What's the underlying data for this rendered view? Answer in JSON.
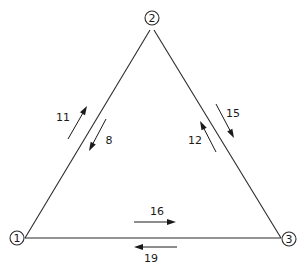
{
  "diagram": {
    "type": "directed-flow-graph",
    "title": "",
    "background_color": "#ffffff",
    "line_color": "#2b2b2b",
    "label_color": "#1a1a1a",
    "nodes": [
      {
        "id": "1",
        "label": "1",
        "x": 17,
        "y": 238,
        "radius": 7
      },
      {
        "id": "2",
        "label": "2",
        "x": 152,
        "y": 18,
        "radius": 7
      },
      {
        "id": "3",
        "label": "3",
        "x": 289,
        "y": 239,
        "radius": 7
      }
    ],
    "edges": [
      {
        "id": "edge-1-2",
        "from": "1",
        "to": "2"
      },
      {
        "id": "edge-2-3",
        "from": "2",
        "to": "3"
      },
      {
        "id": "edge-1-3",
        "from": "1",
        "to": "3"
      }
    ],
    "flows": [
      {
        "id": "flow-1-to-2",
        "value": "11",
        "from": "1",
        "to": "2",
        "direction": "up-right",
        "label_x": 63,
        "label_y": 117,
        "line": {
          "x1": 68,
          "y1": 139,
          "x2": 87,
          "y2": 106
        }
      },
      {
        "id": "flow-2-to-1",
        "value": "8",
        "from": "2",
        "to": "1",
        "direction": "down-left",
        "label_x": 109,
        "label_y": 140,
        "line": {
          "x1": 106,
          "y1": 119,
          "x2": 89,
          "y2": 151
        }
      },
      {
        "id": "flow-3-to-2",
        "value": "12",
        "from": "3",
        "to": "2",
        "direction": "up-left",
        "label_x": 195,
        "label_y": 140,
        "line": {
          "x1": 216,
          "y1": 152,
          "x2": 200,
          "y2": 121
        }
      },
      {
        "id": "flow-2-to-3",
        "value": "15",
        "from": "2",
        "to": "3",
        "direction": "down-right",
        "label_x": 233,
        "label_y": 113,
        "line": {
          "x1": 216,
          "y1": 104,
          "x2": 234,
          "y2": 138
        }
      },
      {
        "id": "flow-1-to-3",
        "value": "16",
        "from": "1",
        "to": "3",
        "direction": "right",
        "label_x": 157,
        "label_y": 211,
        "line": {
          "x1": 134,
          "y1": 222,
          "x2": 176,
          "y2": 222
        }
      },
      {
        "id": "flow-3-to-1",
        "value": "19",
        "from": "3",
        "to": "1",
        "direction": "left",
        "label_x": 151,
        "label_y": 258,
        "line": {
          "x1": 177,
          "y1": 247,
          "x2": 134,
          "y2": 247
        }
      }
    ]
  }
}
